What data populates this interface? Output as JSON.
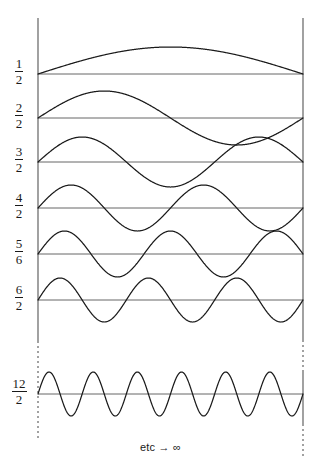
{
  "figure": {
    "caption": "etc → ∞",
    "caption_y": 441,
    "width": 321,
    "height": 474,
    "stroke_color": "#1a1a1a",
    "baseline_color": "#555555",
    "boundary_color": "#555555",
    "background": "#ffffff"
  },
  "boundaries": {
    "left_x": 38,
    "right_x": 303,
    "left_solid": {
      "y1": 18,
      "y2": 341
    },
    "left_dashed": {
      "y1": 341,
      "y2": 440
    },
    "right_solid_top": {
      "y1": 18,
      "y2": 340
    },
    "right_dashed_mid": {
      "y1": 340,
      "y2": 372
    },
    "right_solid_bottom": {
      "y1": 372,
      "y2": 424
    },
    "right_dashed_bottom": {
      "y1": 424,
      "y2": 456
    }
  },
  "chart_data": {
    "type": "line",
    "title": "",
    "subtitle": "",
    "xlabel": "etc → ∞",
    "ylabel": "",
    "grid": false,
    "legend": "none",
    "x_range": [
      0,
      1
    ],
    "x_pixel_range": [
      38,
      303
    ],
    "series": [
      {
        "name": "mode-1",
        "label_numerator": "1",
        "label_denominator": "2",
        "half_wavelengths": 1,
        "baseline_y": 74,
        "amplitude_px": 27,
        "phase_sign": 1
      },
      {
        "name": "mode-2",
        "label_numerator": "2",
        "label_denominator": "2",
        "half_wavelengths": 2,
        "baseline_y": 118,
        "amplitude_px": 27,
        "phase_sign": 1
      },
      {
        "name": "mode-3",
        "label_numerator": "3",
        "label_denominator": "2",
        "half_wavelengths": 3,
        "baseline_y": 162,
        "amplitude_px": 25,
        "phase_sign": 1
      },
      {
        "name": "mode-4",
        "label_numerator": "4",
        "label_denominator": "2",
        "half_wavelengths": 4,
        "baseline_y": 208,
        "amplitude_px": 23,
        "phase_sign": 1
      },
      {
        "name": "mode-5",
        "label_numerator": "5",
        "label_denominator": "6",
        "half_wavelengths": 5,
        "baseline_y": 254,
        "amplitude_px": 23,
        "phase_sign": 1
      },
      {
        "name": "mode-6",
        "label_numerator": "6",
        "label_denominator": "2",
        "half_wavelengths": 6,
        "baseline_y": 300,
        "amplitude_px": 22,
        "phase_sign": 1
      },
      {
        "name": "mode-12",
        "label_numerator": "12",
        "label_denominator": "2",
        "half_wavelengths": 12,
        "baseline_y": 394,
        "amplitude_px": 22,
        "phase_sign": 1
      }
    ]
  }
}
